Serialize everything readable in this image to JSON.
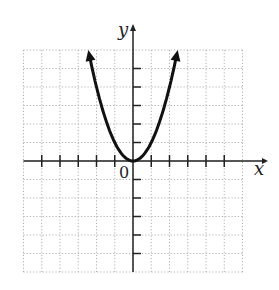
{
  "chart_data": {
    "type": "line",
    "title": "",
    "function": "y = x^2",
    "xlabel": "x",
    "ylabel": "y",
    "origin_label": "0",
    "xlim": [
      -6,
      6
    ],
    "ylim": [
      -6,
      6
    ],
    "grid": true,
    "grid_style": "dotted",
    "x_ticks": [
      -5,
      -4,
      -3,
      -2,
      -1,
      1,
      2,
      3,
      4,
      5
    ],
    "y_ticks": [
      -5,
      -4,
      -3,
      -2,
      -1,
      1,
      2,
      3,
      4,
      5
    ],
    "series": [
      {
        "name": "parabola",
        "x": [
          -2.4,
          -2,
          -1.5,
          -1,
          -0.5,
          0,
          0.5,
          1,
          1.5,
          2,
          2.4
        ],
        "y": [
          5.76,
          4,
          2.25,
          1,
          0.25,
          0,
          0.25,
          1,
          2.25,
          4,
          5.76
        ],
        "arrows_at_ends": true
      }
    ],
    "colors": {
      "curve": "#111111",
      "axis": "#222222",
      "grid": "#b0b0b0"
    }
  }
}
